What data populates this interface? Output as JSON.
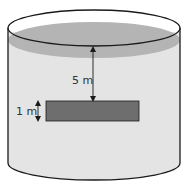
{
  "diagram": {
    "type": "cylindrical-tank-with-submerged-plate",
    "colors": {
      "background": "#ffffff",
      "outline": "#1a1a1a",
      "water_body": "#e4e4e4",
      "water_surface": "#b4b4b4",
      "plate": "#6e6e6e"
    },
    "labels": {
      "depth": "5 m",
      "plate_height": "1 m"
    }
  }
}
